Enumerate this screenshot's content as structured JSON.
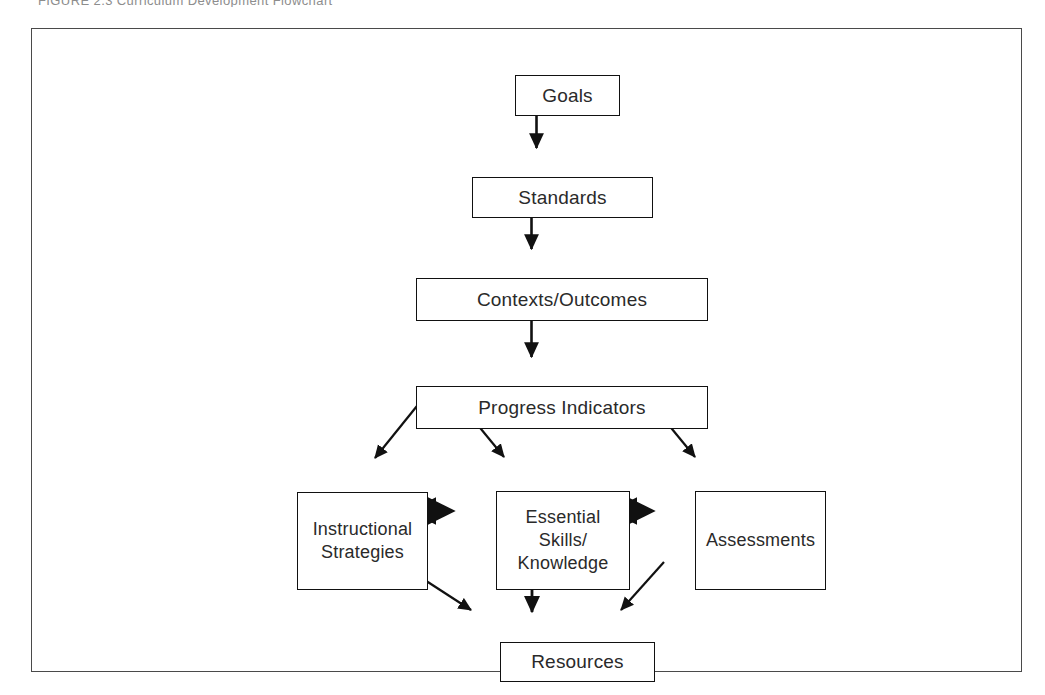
{
  "figure": {
    "caption_partial": "FIGURE 2.3    Curriculum Development Flowchart"
  },
  "diagram": {
    "type": "flowchart",
    "orientation": "top-to-bottom",
    "background_color": "#ffffff",
    "frame_border_color": "#4a4a4a",
    "node_border_color": "#111111",
    "text_color": "#2a2a2a",
    "nodes": [
      {
        "id": "goals",
        "label": "Goals"
      },
      {
        "id": "standards",
        "label": "Standards"
      },
      {
        "id": "contexts",
        "label": "Contexts/Outcomes"
      },
      {
        "id": "progress",
        "label": "Progress Indicators"
      },
      {
        "id": "instructional",
        "label": "Instructional\nStrategies"
      },
      {
        "id": "essential",
        "label": "Essential\nSkills/\nKnowledge"
      },
      {
        "id": "assessments",
        "label": "Assessments"
      },
      {
        "id": "resources",
        "label": "Resources"
      }
    ],
    "edges": [
      {
        "from": "goals",
        "to": "standards",
        "style": "solid",
        "heads": "single"
      },
      {
        "from": "standards",
        "to": "contexts",
        "style": "solid",
        "heads": "single"
      },
      {
        "from": "contexts",
        "to": "progress",
        "style": "solid",
        "heads": "single"
      },
      {
        "from": "progress",
        "to": "instructional",
        "style": "solid",
        "heads": "single"
      },
      {
        "from": "progress",
        "to": "essential",
        "style": "solid",
        "heads": "single"
      },
      {
        "from": "progress",
        "to": "assessments",
        "style": "solid",
        "heads": "single"
      },
      {
        "from": "instructional",
        "to": "essential",
        "style": "dotted",
        "heads": "double"
      },
      {
        "from": "essential",
        "to": "assessments",
        "style": "dotted",
        "heads": "double"
      },
      {
        "from": "instructional",
        "to": "resources",
        "style": "solid",
        "heads": "single"
      },
      {
        "from": "essential",
        "to": "resources",
        "style": "solid",
        "heads": "single"
      },
      {
        "from": "assessments",
        "to": "resources",
        "style": "solid",
        "heads": "single"
      }
    ]
  }
}
